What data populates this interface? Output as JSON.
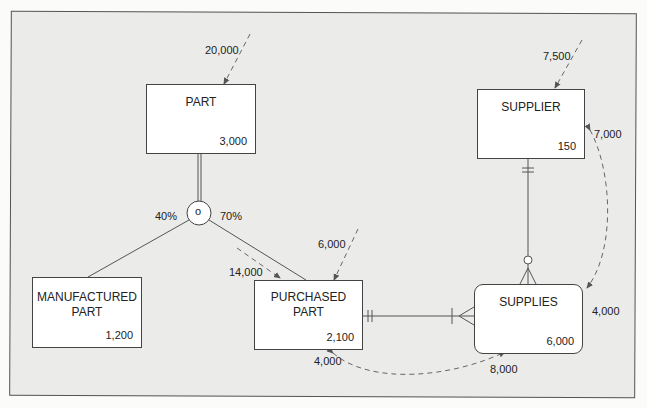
{
  "diagram": {
    "type": "EER transaction-volume / usage map",
    "entities": [
      {
        "id": "part",
        "name": "PART",
        "volume": "3,000",
        "access_in": "20,000"
      },
      {
        "id": "supplier",
        "name": "SUPPLIER",
        "volume": "150",
        "access_in": "7,500"
      },
      {
        "id": "manufactured_part",
        "name": "MANUFACTURED\nPART",
        "volume": "1,200"
      },
      {
        "id": "purchased_part",
        "name": "PURCHASED\nPART",
        "volume": "2,100",
        "access_in": "6,000"
      },
      {
        "id": "supplies",
        "name": "SUPPLIES",
        "volume": "6,000",
        "associative": true
      }
    ],
    "subtype_circle": {
      "symbol": "o",
      "left_pct": "40%",
      "right_pct": "70%"
    },
    "access_labels": {
      "part_in": "20,000",
      "supplier_in": "7,500",
      "purchased_part_in": "6,000",
      "part_to_purchased": "14,000",
      "supplier_to_supplies_top": "7,000",
      "supplier_to_supplies_bottom": "4,000",
      "purchased_supplies_left": "4,000",
      "purchased_supplies_right": "8,000"
    },
    "colors": {
      "frame_bg": "#ebebea",
      "line": "#555555",
      "dashed": "#666666",
      "box_bg": "#ffffff"
    }
  }
}
